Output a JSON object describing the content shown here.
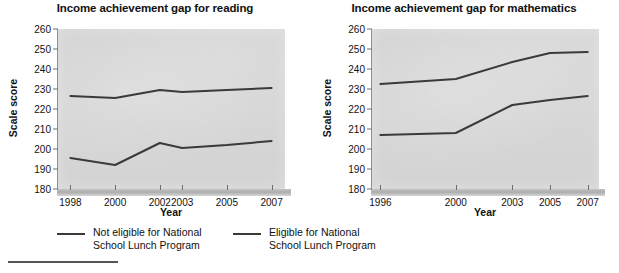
{
  "charts": [
    {
      "id": "reading",
      "title": "Income achievement gap for reading",
      "xlabel": "Year",
      "ylabel": "Scale score"
    },
    {
      "id": "mathematics",
      "title": "Income achievement gap for mathematics",
      "xlabel": "Year",
      "ylabel": "Scale score"
    }
  ],
  "legend": {
    "items": [
      {
        "name": "not-eligible",
        "line1": "Not eligible for National",
        "line2": "School Lunch Program",
        "color": "#3a3a3a"
      },
      {
        "name": "eligible",
        "line1": "Eligible for National",
        "line2": "School Lunch Program",
        "color": "#3a3a3a"
      }
    ]
  },
  "chart_data": [
    {
      "type": "line",
      "title": "Income achievement gap for reading",
      "xlabel": "Year",
      "ylabel": "Scale score",
      "x": [
        1998,
        2000,
        2002,
        2003,
        2005,
        2007
      ],
      "xticklabels": [
        "1998",
        "2000",
        "2002",
        "2003",
        "2005",
        "2007"
      ],
      "xlim": [
        1997.4,
        2007.6
      ],
      "ylim": [
        180,
        260
      ],
      "yticks": [
        180,
        190,
        200,
        210,
        220,
        230,
        240,
        250,
        260
      ],
      "grid": false,
      "legend_position": "below-figure",
      "series": [
        {
          "name": "Not eligible for National School Lunch Program",
          "values": [
            226.5,
            225.5,
            229.5,
            228.5,
            229.5,
            230.5
          ],
          "color": "#3a3a3a"
        },
        {
          "name": "Eligible for National School Lunch Program",
          "values": [
            195.5,
            192.0,
            203.0,
            200.5,
            202.0,
            204.0
          ],
          "color": "#3a3a3a"
        }
      ]
    },
    {
      "type": "line",
      "title": "Income achievement gap for mathematics",
      "xlabel": "Year",
      "ylabel": "Scale score",
      "x": [
        1996,
        2000,
        2003,
        2005,
        2007
      ],
      "xticklabels": [
        "1996",
        "2000",
        "2003",
        "2005",
        "2007"
      ],
      "xlim": [
        1995.5,
        2007.6
      ],
      "ylim": [
        180,
        260
      ],
      "yticks": [
        180,
        190,
        200,
        210,
        220,
        230,
        240,
        250,
        260
      ],
      "grid": false,
      "legend_position": "below-figure",
      "series": [
        {
          "name": "Not eligible for National School Lunch Program",
          "values": [
            232.5,
            235.0,
            243.5,
            248.0,
            248.5
          ],
          "color": "#3a3a3a"
        },
        {
          "name": "Eligible for National School Lunch Program",
          "values": [
            207.0,
            208.0,
            222.0,
            224.5,
            226.5
          ],
          "color": "#3a3a3a"
        }
      ]
    }
  ]
}
